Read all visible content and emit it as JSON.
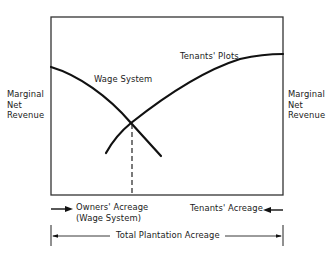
{
  "diagram": {
    "type": "economic-diagram",
    "y_axis_left_label": [
      "Marginal",
      "Net",
      "Revenue"
    ],
    "y_axis_right_label": [
      "Marginal",
      "Net",
      "Revenue"
    ],
    "curves": [
      {
        "name": "Wage System",
        "direction": "downward-sloping from left"
      },
      {
        "name": "Tenants' Plots",
        "direction": "downward-sloping from right"
      }
    ],
    "curve_labels": {
      "wage": "Wage System",
      "tenants": "Tenants' Plots"
    },
    "bottom_labels": {
      "owners_line1": "Owners' Acreage",
      "owners_line2": "(Wage System)",
      "tenants": "Tenants' Acreage",
      "total": "Total Plantation Acreage"
    },
    "colors": {
      "line": "#1a1a1a",
      "background": "#ffffff"
    }
  }
}
